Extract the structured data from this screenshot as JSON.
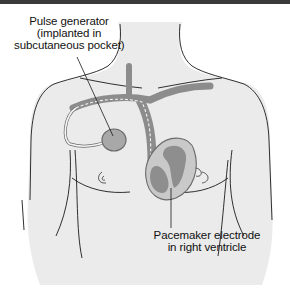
{
  "figure": {
    "colors": {
      "skin": "#ebebeb",
      "outline": "#1a1a1a",
      "vessel": "#8c8c8c",
      "device": "#a8a8a8",
      "heart_wall": "#c9c9c9",
      "heart_chamber": "#8e8e8e",
      "lead": "#f4f4f4",
      "top_bar": "#3a3a3a"
    }
  },
  "labels": {
    "pulse_generator": {
      "line1": "Pulse generator",
      "line2": "(implanted in",
      "line3": "subcutaneous pocket)"
    },
    "electrode": {
      "line1": "Pacemaker electrode",
      "line2": "in right ventricle"
    }
  }
}
